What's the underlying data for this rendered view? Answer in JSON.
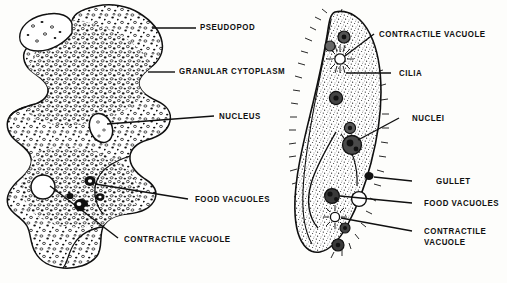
{
  "figure": {
    "type": "biology-diagram",
    "background_color": "#fdfdfb",
    "ink_color": "#101010"
  },
  "organisms": [
    {
      "name": "amoeba",
      "side": "left",
      "labels": [
        {
          "id": "pseudopod",
          "text": "PSEUDOPOD"
        },
        {
          "id": "granular-cytoplasm",
          "text": "GRANULAR  CYTOPLASM"
        },
        {
          "id": "nucleus",
          "text": "NUCLEUS"
        },
        {
          "id": "food-vacuoles",
          "text": "FOOD  VACUOLES"
        },
        {
          "id": "contractile-vacuole",
          "text": "CONTRACTILE  VACUOLE"
        }
      ]
    },
    {
      "name": "paramecium",
      "side": "right",
      "labels": [
        {
          "id": "contractile-vacuole-top",
          "text": "CONTRACTILE  VACUOLE"
        },
        {
          "id": "cilia",
          "text": "CILIA"
        },
        {
          "id": "nuclei",
          "text": "NUCLEI"
        },
        {
          "id": "gullet",
          "text": "GULLET"
        },
        {
          "id": "food-vacuoles",
          "text": "FOOD  VACUOLES"
        },
        {
          "id": "contractile-vacuole-bottom",
          "text": "CONTRACTILE\nVACUOLE"
        }
      ]
    }
  ]
}
